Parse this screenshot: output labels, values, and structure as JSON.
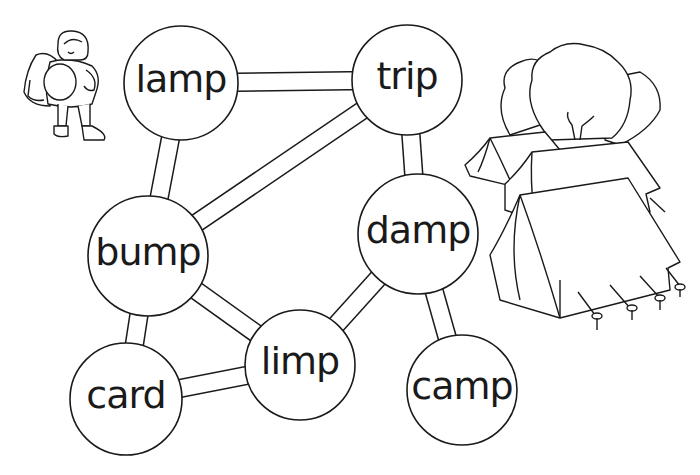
{
  "worksheet": {
    "type": "word-path maze",
    "line_color": "#1a1a1a",
    "fill_color": "#ffffff",
    "nodes": [
      {
        "id": "lamp",
        "label": "lamp",
        "cx": 181,
        "cy": 83,
        "r": 57
      },
      {
        "id": "trip",
        "label": "trip",
        "cx": 407,
        "cy": 80,
        "r": 55
      },
      {
        "id": "bump",
        "label": "bump",
        "cx": 148,
        "cy": 256,
        "r": 60
      },
      {
        "id": "damp",
        "label": "damp",
        "cx": 418,
        "cy": 234,
        "r": 60
      },
      {
        "id": "limp",
        "label": "limp",
        "cx": 300,
        "cy": 365,
        "r": 55
      },
      {
        "id": "card",
        "label": "card",
        "cx": 126,
        "cy": 399,
        "r": 56
      },
      {
        "id": "camp",
        "label": "camp",
        "cx": 462,
        "cy": 390,
        "r": 55
      }
    ],
    "paths": [
      [
        "lamp",
        "trip"
      ],
      [
        "lamp",
        "bump"
      ],
      [
        "trip",
        "bump"
      ],
      [
        "trip",
        "damp"
      ],
      [
        "bump",
        "card"
      ],
      [
        "bump",
        "limp"
      ],
      [
        "damp",
        "limp"
      ],
      [
        "damp",
        "camp"
      ],
      [
        "card",
        "limp"
      ]
    ],
    "illustrations": [
      "hiker-with-backpack",
      "trees-and-tents"
    ]
  }
}
